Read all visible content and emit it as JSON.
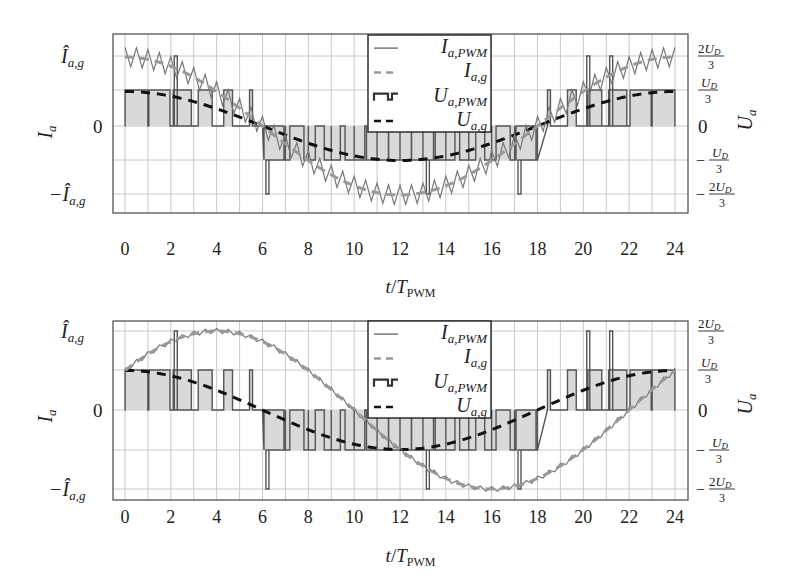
{
  "chart_data": [
    {
      "type": "line",
      "panel": "top",
      "x_range": [
        0,
        24
      ],
      "xlabel": "t/T_PWM",
      "xticks": [
        0,
        2,
        4,
        6,
        8,
        10,
        12,
        14,
        16,
        18,
        20,
        22,
        24
      ],
      "ylabel_left": "I_a",
      "ylabel_right": "U_a",
      "yticks_left": [
        "-Î_a,g",
        "0",
        "Î_a,g"
      ],
      "yticks_right": [
        "-2U_D/3",
        "-U_D/3",
        "0",
        "U_D/3",
        "2U_D/3"
      ],
      "grid": true,
      "legend_position": "upper center",
      "legend": [
        "I_a,PWM",
        "I_a,g",
        "U_a,PWM",
        "U_a,g"
      ],
      "note": "Current in phase with voltage; I_a,g amplitude equals 2U_D/3 level, U_a,g amplitude about 1/2 of it",
      "current_phase_deg": 0,
      "current_amplitude_norm": 1.0,
      "voltage_amplitude_norm": 0.5,
      "series": [
        {
          "name": "I_a,PWM",
          "style": "solid thin gray",
          "description": "ripple around I_a,g, ripple approx ±0.15"
        },
        {
          "name": "I_a,g",
          "style": "dashed gray",
          "x": [
            0,
            2,
            4,
            6,
            8,
            10,
            12,
            14,
            16,
            18,
            20,
            22,
            24
          ],
          "values": [
            1.0,
            0.87,
            0.5,
            0.0,
            -0.5,
            -0.87,
            -1.0,
            -0.87,
            -0.5,
            0.0,
            0.5,
            0.87,
            1.0
          ]
        },
        {
          "name": "U_a,PWM",
          "style": "step, gray fill",
          "levels": [
            "-2U_D/3",
            "-U_D/3",
            "0",
            "U_D/3",
            "2U_D/3"
          ]
        },
        {
          "name": "U_a,g",
          "style": "dashed black",
          "x": [
            0,
            2,
            4,
            6,
            8,
            10,
            12,
            14,
            16,
            18,
            20,
            22,
            24
          ],
          "values": [
            0.5,
            0.43,
            0.25,
            0.0,
            -0.25,
            -0.43,
            -0.5,
            -0.43,
            -0.25,
            0.0,
            0.25,
            0.43,
            0.5
          ]
        }
      ]
    },
    {
      "type": "line",
      "panel": "bottom",
      "x_range": [
        0,
        24
      ],
      "xlabel": "t/T_PWM",
      "xticks": [
        0,
        2,
        4,
        6,
        8,
        10,
        12,
        14,
        16,
        18,
        20,
        22,
        24
      ],
      "ylabel_left": "I_a",
      "ylabel_right": "U_a",
      "yticks_left": [
        "-Î_a,g",
        "0",
        "Î_a,g"
      ],
      "yticks_right": [
        "-2U_D/3",
        "-U_D/3",
        "0",
        "U_D/3",
        "2U_D/3"
      ],
      "grid": true,
      "legend_position": "upper center",
      "legend": [
        "I_a,PWM",
        "I_a,g",
        "U_a,PWM",
        "U_a,g"
      ],
      "note": "Current lags voltage by about 60 degrees; peak current at t≈4, minimum at t≈16",
      "current_phase_deg": -60,
      "current_amplitude_norm": 1.0,
      "voltage_amplitude_norm": 0.5,
      "series": [
        {
          "name": "I_a,PWM",
          "style": "solid thin gray",
          "description": "small ripple around I_a,g"
        },
        {
          "name": "I_a,g",
          "style": "dashed gray",
          "x": [
            0,
            4,
            8,
            10,
            12,
            16,
            20,
            22,
            24
          ],
          "values": [
            0.5,
            1.0,
            0.5,
            0.0,
            -0.5,
            -1.0,
            -0.5,
            0.0,
            0.5
          ]
        },
        {
          "name": "U_a,PWM",
          "style": "step, gray fill",
          "levels": [
            "-2U_D/3",
            "-U_D/3",
            "0",
            "U_D/3",
            "2U_D/3"
          ]
        },
        {
          "name": "U_a,g",
          "style": "dashed black",
          "x": [
            0,
            2,
            4,
            6,
            8,
            10,
            12,
            14,
            16,
            18,
            20,
            22,
            24
          ],
          "values": [
            0.5,
            0.43,
            0.25,
            0.0,
            -0.25,
            -0.43,
            -0.5,
            -0.43,
            -0.25,
            0.0,
            0.25,
            0.43,
            0.5
          ]
        }
      ]
    }
  ],
  "panels": [
    {
      "frame": {
        "left": 113,
        "right": 688,
        "top": 34,
        "bottom": 213
      },
      "x0px": 125,
      "x24px": 675,
      "levels_px": {
        "p2": 56,
        "p1": 90,
        "z": 126,
        "m1": 160,
        "m2": 194
      },
      "tick_label_y": 255,
      "xlabel_y": 293,
      "legend": {
        "x": 368,
        "y": 35,
        "w": 123,
        "h": 97
      }
    },
    {
      "frame": {
        "left": 113,
        "right": 688,
        "top": 321,
        "bottom": 500
      },
      "x0px": 125,
      "x24px": 675,
      "levels_px": {
        "p2": 331,
        "p1": 370,
        "z": 410,
        "m1": 450,
        "m2": 489
      },
      "tick_label_y": 523,
      "xlabel_y": 562,
      "legend": {
        "x": 368,
        "y": 321,
        "w": 123,
        "h": 97
      }
    }
  ],
  "labels": {
    "xtick_labels": [
      "0",
      "2",
      "4",
      "6",
      "8",
      "10",
      "12",
      "14",
      "16",
      "18",
      "20",
      "22",
      "24"
    ],
    "left_ylabel": "I",
    "left_ylabel_sub": "a",
    "right_ylabel": "U",
    "right_ylabel_sub": "a",
    "left_ticks": {
      "top_main": "Î",
      "top_sub": "a,g",
      "zero": "0",
      "bot_main": "−Î",
      "bot_sub": "a,g"
    },
    "right_ticks": {
      "p2_num": "2U",
      "p2_sub": "D",
      "den": "3",
      "p1_num": "U",
      "p1_sub": "D",
      "zero": "0",
      "minus": "−"
    },
    "xlabel_t": "t",
    "xlabel_slash": "/",
    "xlabel_T": "T",
    "xlabel_sub": "PWM",
    "legend_items": [
      {
        "main": "I",
        "sub": "a,PWM"
      },
      {
        "main": "I",
        "sub": "a,g"
      },
      {
        "main": "U",
        "sub": "a,PWM"
      },
      {
        "main": "U",
        "sub": "a,g"
      }
    ]
  },
  "colors": {
    "frame": "#555555",
    "grid": "#c8c8c8",
    "pwm_fill": "#d9d9d9",
    "pwm_stroke": "#555555",
    "i_pwm": "#777777",
    "i_g": "#999999",
    "u_g": "#111111",
    "text": "#222222"
  }
}
